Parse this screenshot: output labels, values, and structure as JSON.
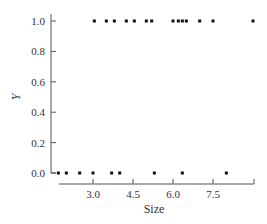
{
  "chart_data": {
    "type": "scatter",
    "title": "",
    "xlabel": "Size",
    "ylabel": "Y",
    "xlim": [
      1.5,
      9.0
    ],
    "ylim": [
      0.0,
      1.0
    ],
    "x_ticks": [
      "3.0",
      "4.5",
      "6.0",
      "7.5"
    ],
    "y_ticks": [
      "0.0",
      "0.2",
      "0.4",
      "0.6",
      "0.8",
      "1.0"
    ],
    "grid": false,
    "legend": null,
    "series": [
      {
        "name": "Y = 1",
        "points": [
          {
            "x": 3.05,
            "y": 1
          },
          {
            "x": 3.5,
            "y": 1
          },
          {
            "x": 3.8,
            "y": 1
          },
          {
            "x": 4.25,
            "y": 1
          },
          {
            "x": 4.55,
            "y": 1
          },
          {
            "x": 5.0,
            "y": 1
          },
          {
            "x": 5.2,
            "y": 1
          },
          {
            "x": 6.0,
            "y": 1
          },
          {
            "x": 6.2,
            "y": 1
          },
          {
            "x": 6.35,
            "y": 1
          },
          {
            "x": 6.5,
            "y": 1
          },
          {
            "x": 7.0,
            "y": 1
          },
          {
            "x": 7.5,
            "y": 1
          },
          {
            "x": 9.0,
            "y": 1
          }
        ]
      },
      {
        "name": "Y = 0",
        "points": [
          {
            "x": 1.7,
            "y": 0
          },
          {
            "x": 2.0,
            "y": 0
          },
          {
            "x": 2.5,
            "y": 0
          },
          {
            "x": 3.0,
            "y": 0
          },
          {
            "x": 3.7,
            "y": 0
          },
          {
            "x": 4.0,
            "y": 0
          },
          {
            "x": 5.3,
            "y": 0
          },
          {
            "x": 6.35,
            "y": 0
          },
          {
            "x": 8.0,
            "y": 0
          }
        ]
      }
    ]
  }
}
